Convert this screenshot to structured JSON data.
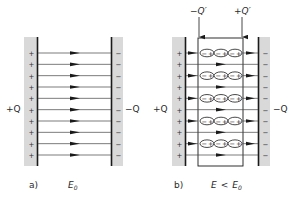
{
  "figure": {
    "colors": {
      "plate_fill": "#d9d9d9",
      "plate_edge": "#1a1a1a",
      "field_line": "#333333",
      "text": "#2a2a2a"
    }
  },
  "panel_a": {
    "label": "a)",
    "field_label": "E",
    "field_subscript": "0",
    "left_charge_label": "+Q",
    "right_charge_label": "−Q",
    "plus_sign": "+",
    "minus_sign": "−",
    "field_line_count": 10
  },
  "panel_b": {
    "label": "b)",
    "field_label": "E",
    "relation": "<",
    "field_ref": "E",
    "field_ref_subscript": "0",
    "left_charge_label": "+Q",
    "right_charge_label": "−Q",
    "induced_neg_label": "−Q′",
    "induced_pos_label": "+Q′",
    "plus_sign": "+",
    "minus_sign": "−",
    "dipole_rows": 5,
    "dipoles_per_row": 3,
    "dipole_neg": "−",
    "dipole_pos": "+"
  }
}
